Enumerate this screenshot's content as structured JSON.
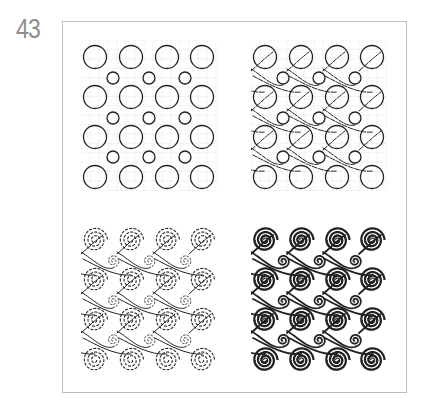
{
  "figure": {
    "number": "43",
    "ink_color": "#222222",
    "grid_color": "#e6e6e6",
    "frame_color": "#bdbdbd",
    "number_color": "#8c8c8c"
  },
  "grid": {
    "big_cols_x": [
      0,
      36,
      72,
      107
    ],
    "big_rows_y": [
      0,
      40,
      80,
      120
    ],
    "small_cols_x": [
      18,
      54,
      90
    ],
    "small_rows_y": [
      21,
      61,
      100
    ],
    "big_radius": 11.5,
    "small_radius": 6
  },
  "panels": [
    {
      "id": "step-1-circles",
      "label": "Circle layout",
      "origin": [
        95,
        57
      ],
      "style": "circles"
    },
    {
      "id": "step-2-s-curves",
      "label": "Circles connected by S-curves",
      "origin": [
        265,
        57
      ],
      "style": "curves"
    },
    {
      "id": "step-3-dashed-spirals",
      "label": "Dashed spirals",
      "origin": [
        95,
        240
      ],
      "style": "dashed-spirals"
    },
    {
      "id": "step-4-filled-spirals",
      "label": "Filled spirals",
      "origin": [
        265,
        240
      ],
      "style": "bold-spirals"
    }
  ]
}
